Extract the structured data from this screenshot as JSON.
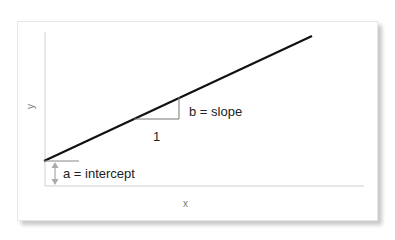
{
  "diagram": {
    "type": "linear-regression-illustration",
    "axes": {
      "x_label": "x",
      "y_label": "y"
    },
    "line": {
      "start": [
        44,
        161
      ],
      "end": [
        312,
        36
      ],
      "color": "#111111"
    },
    "slope_triangle": {
      "run_label": "1",
      "rise_label": "b = slope"
    },
    "intercept": {
      "label": "a = intercept",
      "arrow_color": "#999999"
    }
  }
}
